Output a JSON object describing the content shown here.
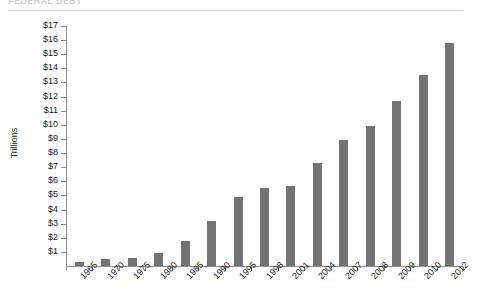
{
  "heading": {
    "text": "FEDERAL DEBT"
  },
  "chart_data": {
    "type": "bar",
    "title": "",
    "subtitle": "",
    "xlabel": "",
    "ylabel": "Trillions",
    "categories": [
      "1965",
      "1970",
      "1975",
      "1980",
      "1985",
      "1990",
      "1995",
      "1998",
      "2001",
      "2004",
      "2007",
      "2008",
      "2009",
      "2010",
      "2012"
    ],
    "values": [
      0.3,
      0.5,
      0.6,
      0.9,
      1.8,
      3.2,
      4.9,
      5.5,
      5.7,
      7.3,
      8.9,
      9.9,
      11.7,
      13.5,
      15.8
    ],
    "series": [
      {
        "name": "Federal Debt",
        "values": [
          0.3,
          0.5,
          0.6,
          0.9,
          1.8,
          3.2,
          4.9,
          5.5,
          5.7,
          7.3,
          8.9,
          9.9,
          11.7,
          13.5,
          15.8
        ]
      }
    ],
    "ylim": [
      0,
      17
    ],
    "ytick_values": [
      1,
      2,
      3,
      4,
      5,
      6,
      7,
      8,
      9,
      10,
      11,
      12,
      13,
      14,
      15,
      16,
      17
    ],
    "ytick_labels": [
      "$1",
      "$2",
      "$3",
      "$4",
      "$5",
      "$6",
      "$7",
      "$8",
      "$9",
      "$10",
      "$11",
      "$12",
      "$13",
      "$14",
      "$15",
      "$16",
      "$17"
    ],
    "grid": false,
    "legend": "none",
    "bar_color": "#737373",
    "axis_color": "#8c8c8c",
    "text_color": "#1a1a1a",
    "xtick_rotation": -45
  }
}
